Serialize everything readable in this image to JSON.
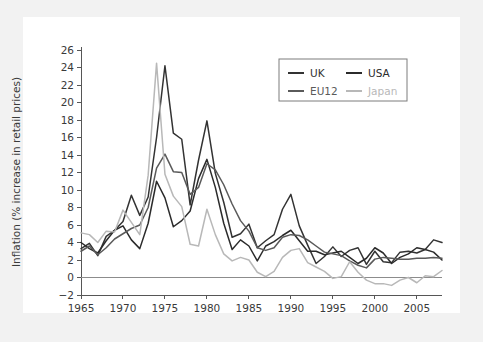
{
  "figure": {
    "background_color": "#f2f2f2",
    "panel_color": "#ffffff",
    "axis_color": "#565656"
  },
  "chart_data": {
    "type": "line",
    "title": "",
    "xlabel": "",
    "ylabel": "Inflation (% increase in retail prices)",
    "xlim": [
      1965,
      2008
    ],
    "ylim": [
      -2,
      26
    ],
    "ytick_step": 2,
    "xtick_step": 5,
    "grid": false,
    "legend_position": "top-right",
    "xticks": [
      1965,
      1970,
      1975,
      1980,
      1985,
      1990,
      1995,
      2000,
      2005
    ],
    "xtick_labels": [
      "1965",
      "1970",
      "1975",
      "1980",
      "1985",
      "1990",
      "1995",
      "2000",
      "2005"
    ],
    "yticks": [
      -2,
      0,
      2,
      4,
      6,
      8,
      10,
      12,
      14,
      16,
      18,
      20,
      22,
      24,
      26
    ],
    "ytick_labels": [
      "−2",
      "0",
      "2",
      "4",
      "6",
      "8",
      "10",
      "12",
      "14",
      "16",
      "18",
      "20",
      "22",
      "24",
      "26"
    ],
    "x": [
      1965,
      1966,
      1967,
      1968,
      1969,
      1970,
      1971,
      1972,
      1973,
      1974,
      1975,
      1976,
      1977,
      1978,
      1979,
      1980,
      1981,
      1982,
      1983,
      1984,
      1985,
      1986,
      1987,
      1988,
      1989,
      1990,
      1991,
      1992,
      1993,
      1994,
      1995,
      1996,
      1997,
      1998,
      1999,
      2000,
      2001,
      2002,
      2003,
      2004,
      2005,
      2006,
      2007,
      2008
    ],
    "series": [
      {
        "name": "UK",
        "color": "#333333",
        "values": [
          3.3,
          3.9,
          2.5,
          4.7,
          5.4,
          6.4,
          9.4,
          7.1,
          9.2,
          16.0,
          24.2,
          16.5,
          15.8,
          8.3,
          13.4,
          17.9,
          11.9,
          8.6,
          4.6,
          5.0,
          6.1,
          3.4,
          4.2,
          4.9,
          7.8,
          9.5,
          5.9,
          3.7,
          1.6,
          2.4,
          3.5,
          2.4,
          3.1,
          3.4,
          1.5,
          3.0,
          1.8,
          1.7,
          2.9,
          3.0,
          2.8,
          3.2,
          4.3,
          4.0
        ],
        "values_display": [
          3.3,
          3.9,
          2.5,
          4.7,
          5.4,
          6.4,
          9.4,
          7.1,
          9.2,
          16.0,
          24.2,
          16.5,
          15.8,
          8.3,
          13.4,
          17.9,
          11.9,
          8.6,
          4.6,
          5.0,
          6.1,
          3.4,
          4.2,
          4.9,
          7.8,
          9.5,
          5.9,
          3.7,
          1.6,
          2.4,
          3.5,
          2.4,
          3.1,
          3.4,
          1.5,
          3.0,
          1.8,
          1.7,
          2.9,
          3.0,
          2.8,
          3.2,
          4.3,
          4.0
        ]
      },
      {
        "name": "USA",
        "color": "#2b2b2b",
        "values": [
          4.0,
          3.3,
          2.8,
          4.2,
          5.4,
          5.9,
          4.3,
          3.3,
          6.2,
          11.0,
          9.1,
          5.8,
          6.5,
          7.6,
          11.3,
          13.5,
          10.3,
          6.2,
          3.2,
          4.3,
          3.6,
          1.9,
          3.6,
          4.1,
          4.8,
          5.4,
          4.2,
          3.0,
          3.0,
          2.6,
          2.8,
          3.0,
          2.3,
          1.6,
          2.2,
          3.4,
          2.8,
          1.6,
          2.3,
          2.7,
          3.4,
          3.2,
          2.9,
          2.0
        ],
        "values_display": [
          4.0,
          3.3,
          2.8,
          4.2,
          5.4,
          5.9,
          4.3,
          3.3,
          6.2,
          11.0,
          9.1,
          5.8,
          6.5,
          7.6,
          11.3,
          13.5,
          10.3,
          6.2,
          3.2,
          4.3,
          3.6,
          1.9,
          3.6,
          4.1,
          4.8,
          5.4,
          4.2,
          3.0,
          3.0,
          2.6,
          2.8,
          3.0,
          2.3,
          1.6,
          2.2,
          3.4,
          2.8,
          1.6,
          2.3,
          2.7,
          3.4,
          3.2,
          2.9,
          2.0
        ]
      },
      {
        "name": "EU12",
        "color": "#5a5a5a",
        "values": [
          3.0,
          3.6,
          2.6,
          3.4,
          4.4,
          5.0,
          5.6,
          6.0,
          8.0,
          12.5,
          14.1,
          12.1,
          12.0,
          9.5,
          10.3,
          13.0,
          12.3,
          10.6,
          8.4,
          6.5,
          5.3,
          3.4,
          3.1,
          3.4,
          4.6,
          4.9,
          4.8,
          4.3,
          3.6,
          2.9,
          2.7,
          2.5,
          1.9,
          1.4,
          1.1,
          2.1,
          2.3,
          2.2,
          2.1,
          2.1,
          2.2,
          2.2,
          2.3,
          2.2
        ],
        "values_display": [
          3.0,
          3.6,
          2.6,
          3.4,
          4.4,
          5.0,
          5.6,
          6.0,
          8.0,
          12.5,
          14.1,
          12.1,
          12.0,
          9.5,
          10.3,
          13.0,
          12.3,
          10.6,
          8.4,
          6.5,
          5.3,
          3.4,
          3.1,
          3.4,
          4.6,
          4.9,
          4.8,
          4.3,
          3.6,
          2.9,
          2.7,
          2.5,
          1.9,
          1.4,
          1.1,
          2.1,
          2.3,
          2.2,
          2.1,
          2.1,
          2.2,
          2.2,
          2.3,
          2.2
        ]
      },
      {
        "name": "Japan",
        "color": "#b8b8b8",
        "values": [
          5.1,
          4.9,
          4.0,
          5.3,
          5.2,
          7.7,
          6.3,
          4.9,
          11.7,
          24.5,
          11.8,
          9.3,
          8.1,
          3.8,
          3.6,
          7.8,
          4.9,
          2.7,
          1.9,
          2.3,
          2.0,
          0.6,
          0.1,
          0.7,
          2.3,
          3.1,
          3.3,
          1.7,
          1.2,
          0.7,
          -0.1,
          0.1,
          1.8,
          0.6,
          -0.3,
          -0.7,
          -0.7,
          -0.9,
          -0.3,
          0.0,
          -0.6,
          0.2,
          0.1,
          0.8
        ],
        "values_display": [
          5.1,
          4.9,
          4.0,
          5.3,
          5.2,
          7.7,
          6.3,
          4.9,
          11.7,
          24.5,
          11.8,
          9.3,
          8.1,
          3.8,
          3.6,
          7.8,
          4.9,
          2.7,
          1.9,
          2.3,
          2.0,
          0.6,
          0.1,
          0.7,
          2.3,
          3.1,
          3.3,
          1.7,
          1.2,
          0.7,
          -0.1,
          0.1,
          1.8,
          0.6,
          -0.3,
          -0.7,
          -0.7,
          -0.9,
          -0.3,
          0.0,
          -0.6,
          0.2,
          0.1,
          0.8
        ]
      }
    ],
    "legend": [
      {
        "label": "UK",
        "color": "#333333"
      },
      {
        "label": "USA",
        "color": "#2b2b2b"
      },
      {
        "label": "EU12",
        "color": "#5a5a5a"
      },
      {
        "label": "Japan",
        "color": "#b8b8b8"
      }
    ]
  }
}
